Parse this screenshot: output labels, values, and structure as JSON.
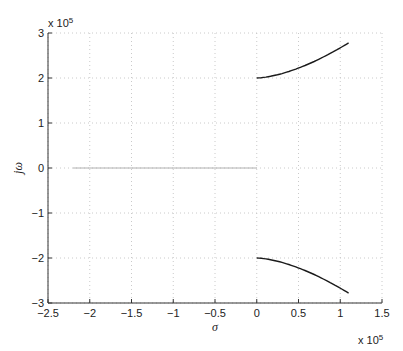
{
  "chart_data": {
    "type": "line",
    "title": "",
    "xlabel": "σ",
    "ylabel": "jω",
    "x_multiplier": "x 10^5",
    "y_multiplier": "x 10^5",
    "xlim": [
      -2.5,
      1.5
    ],
    "ylim": [
      -3,
      3
    ],
    "xticks": [
      -2.5,
      -2,
      -1.5,
      -1,
      -0.5,
      0,
      0.5,
      1,
      1.5
    ],
    "xtick_labels": [
      "-2.5",
      "-2",
      "-1.5",
      "-1",
      "-0.5",
      "0",
      "0.5",
      "1",
      "1.5"
    ],
    "yticks": [
      -3,
      -2,
      -1,
      0,
      1,
      2,
      3
    ],
    "ytick_labels": [
      "-3",
      "-2",
      "-1",
      "0",
      "1",
      "2",
      "3"
    ],
    "grid": true,
    "legend": null,
    "series": [
      {
        "name": "upper branch",
        "color": "#1a1a1a",
        "x": [
          0,
          0.1,
          0.2,
          0.3,
          0.4,
          0.5,
          0.6,
          0.7,
          0.8,
          0.9,
          1.0,
          1.1
        ],
        "y": [
          2.0,
          2.005,
          2.02,
          2.045,
          2.08,
          2.125,
          2.18,
          2.245,
          2.32,
          2.4,
          2.49,
          2.78
        ]
      },
      {
        "name": "lower branch",
        "color": "#1a1a1a",
        "x": [
          0,
          0.1,
          0.2,
          0.3,
          0.4,
          0.5,
          0.6,
          0.7,
          0.8,
          0.9,
          1.0,
          1.1
        ],
        "y": [
          -2.0,
          -2.005,
          -2.02,
          -2.045,
          -2.08,
          -2.125,
          -2.18,
          -2.245,
          -2.32,
          -2.4,
          -2.49,
          -2.78
        ]
      },
      {
        "name": "real axis segment",
        "color": "#b0b0b0",
        "x": [
          -2.2,
          0
        ],
        "y": [
          0,
          0
        ]
      }
    ]
  },
  "labels": {
    "xlabel": "σ",
    "ylabel": "jω",
    "x_exp_base": "x 10",
    "x_exp_power": "5",
    "y_exp_base": "x 10",
    "y_exp_power": "5"
  }
}
